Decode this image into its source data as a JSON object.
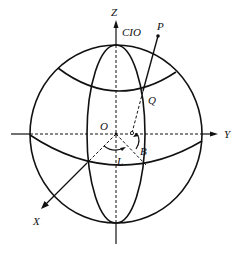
{
  "diagram": {
    "type": "geodetic coordinate sphere",
    "labels": {
      "z_axis": "Z",
      "cio": "CIO",
      "point_p": "P",
      "point_q": "Q",
      "origin": "O",
      "y_axis": "Y",
      "x_axis": "X",
      "longitude": "L",
      "latitude": "B"
    },
    "colors": {
      "stroke": "#111111",
      "background": "#ffffff"
    }
  }
}
